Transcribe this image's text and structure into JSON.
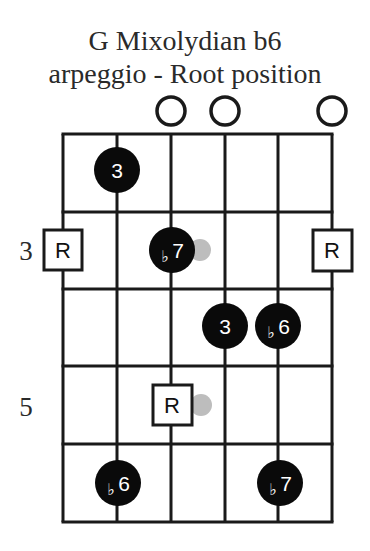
{
  "title": {
    "line1": "G Mixolydian b6",
    "line2": "arpeggio - Root position"
  },
  "fretboard": {
    "strings": 6,
    "frets_shown": 5,
    "start_fret": 2,
    "fret_labels": [
      {
        "fret_row": 2,
        "label": "3"
      },
      {
        "fret_row": 4,
        "label": "5"
      }
    ],
    "open_strings": [
      3,
      4,
      6
    ],
    "notes": [
      {
        "string": 2,
        "fret_row": 1,
        "type": "dot",
        "label": "3"
      },
      {
        "string": 1,
        "fret_row": 2,
        "type": "root",
        "label": "R"
      },
      {
        "string": 3,
        "fret_row": 2,
        "type": "dot",
        "label": "b7",
        "ghost": true
      },
      {
        "string": 6,
        "fret_row": 2,
        "type": "root",
        "label": "R"
      },
      {
        "string": 4,
        "fret_row": 3,
        "type": "dot",
        "label": "3"
      },
      {
        "string": 5,
        "fret_row": 3,
        "type": "dot",
        "label": "b6"
      },
      {
        "string": 3,
        "fret_row": 4,
        "type": "root",
        "label": "R",
        "ghost": true
      },
      {
        "string": 2,
        "fret_row": 5,
        "type": "dot",
        "label": "b6"
      },
      {
        "string": 5,
        "fret_row": 5,
        "type": "dot",
        "label": "b7"
      }
    ]
  },
  "colors": {
    "dot": "#0a0a0a",
    "line": "#1a1a1a",
    "ghost": "#bdbdbd",
    "text": "#2a2a2a"
  },
  "labels": {
    "fret3": "3",
    "fret5": "5",
    "n_3a": "3",
    "n_b7a_flat": "♭",
    "n_b7a_num": "7",
    "n_Ra": "R",
    "n_Rb": "R",
    "n_3b": "3",
    "n_b6a_flat": "♭",
    "n_b6a_num": "6",
    "n_Rc": "R",
    "n_b6b_flat": "♭",
    "n_b6b_num": "6",
    "n_b7b_flat": "♭",
    "n_b7b_num": "7"
  }
}
